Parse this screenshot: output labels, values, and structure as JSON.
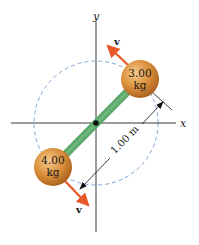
{
  "diagram": {
    "axes": {
      "x_label": "x",
      "y_label": "y"
    },
    "masses": [
      {
        "value": "3.00",
        "unit": "kg",
        "position": "upper-right"
      },
      {
        "value": "4.00",
        "unit": "kg",
        "position": "lower-left"
      }
    ],
    "velocity_labels": [
      {
        "label": "v",
        "position": "upper"
      },
      {
        "label": "v",
        "position": "lower"
      }
    ],
    "dimension": {
      "label": "1.00 m"
    },
    "colors": {
      "rod": "#5aa86a",
      "ball": "#d98f3a",
      "velocity_arrow": "#e8582a",
      "circle": "#7fa7d6",
      "axes": "#222222"
    }
  }
}
